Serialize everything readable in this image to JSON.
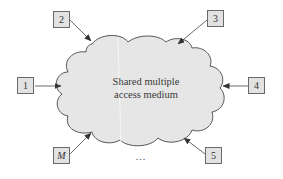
{
  "diagram": {
    "medium": {
      "label_line1": "Shared multiple",
      "label_line2": "access medium",
      "fill": "#e6e6e6",
      "stroke": "#555555"
    },
    "stations": [
      {
        "id": "1",
        "label": "1",
        "position": "left"
      },
      {
        "id": "2",
        "label": "2",
        "position": "top-left"
      },
      {
        "id": "3",
        "label": "3",
        "position": "top-right"
      },
      {
        "id": "4",
        "label": "4",
        "position": "right"
      },
      {
        "id": "5",
        "label": "5",
        "position": "bottom-right"
      },
      {
        "id": "M",
        "label": "M",
        "position": "bottom-left"
      }
    ],
    "ellipsis": "...",
    "colors": {
      "box_fill": "#e2e2e2",
      "box_border": "#6a6a6a",
      "arrow": "#444444"
    }
  }
}
